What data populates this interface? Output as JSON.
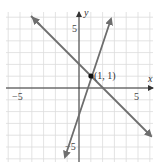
{
  "chart_data": {
    "type": "line",
    "title": "",
    "xlabel": "x",
    "ylabel": "y",
    "xlim": [
      -6.5,
      6.5
    ],
    "ylim": [
      -6.5,
      6.5
    ],
    "grid": true,
    "tick_labels": {
      "x": [
        {
          "value": -5,
          "label": "−5"
        },
        {
          "value": 5,
          "label": "5"
        }
      ],
      "y": [
        {
          "value": 5,
          "label": "5"
        },
        {
          "value": -5,
          "label": "−5"
        }
      ]
    },
    "series": [
      {
        "name": "line-1",
        "equation": "y = -x + 2",
        "x": [
          -4,
          6
        ],
        "y": [
          6,
          -4
        ],
        "color": "#707070"
      },
      {
        "name": "line-2",
        "equation": "y = 3x - 2",
        "x": [
          -1.2,
          2.6
        ],
        "y": [
          -5.6,
          5.8
        ],
        "color": "#707070"
      }
    ],
    "annotations": [
      {
        "type": "point",
        "x": 1,
        "y": 1,
        "label": "(1, 1)"
      }
    ]
  },
  "labels": {
    "x_axis": "x",
    "y_axis": "y",
    "x_tick_neg5": "−5",
    "x_tick_5": "5",
    "y_tick_5": "5",
    "y_tick_neg5": "−5",
    "point": "(1, 1)"
  },
  "colors": {
    "grid": "#dcdcdc",
    "axis": "#333333",
    "line": "#6e6e6e",
    "point": "#111111"
  }
}
